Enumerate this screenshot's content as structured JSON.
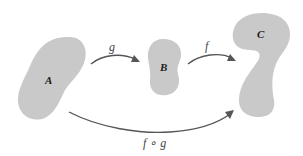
{
  "diagram": {
    "type": "function-composition",
    "sets": [
      {
        "id": "A",
        "label": "A",
        "color": "#c9c9c9"
      },
      {
        "id": "B",
        "label": "B",
        "color": "#c9c9c9"
      },
      {
        "id": "C",
        "label": "C",
        "color": "#c9c9c9"
      }
    ],
    "arrows": [
      {
        "from": "A",
        "to": "B",
        "label": "g"
      },
      {
        "from": "B",
        "to": "C",
        "label": "f"
      },
      {
        "from": "A",
        "to": "C",
        "label": "f ∘ g"
      }
    ],
    "colors": {
      "shape_fill": "#c9c9c9",
      "arrow": "#555555",
      "background": "#ffffff"
    }
  }
}
